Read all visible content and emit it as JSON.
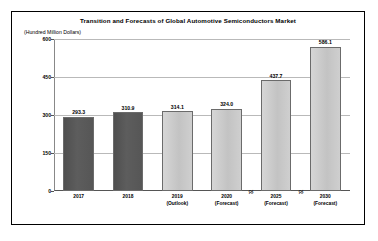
{
  "chart_data": {
    "type": "bar",
    "title": "Transition and Forecasts of Global Automotive Semiconductors Market",
    "unit_label": "(Hundred Million Dollars)",
    "xlabel": "",
    "ylabel": "",
    "ylim": [
      0,
      600
    ],
    "yticks": [
      "0",
      "150",
      "300",
      "450",
      "600"
    ],
    "ytick_values": [
      0,
      150,
      300,
      450,
      600
    ],
    "grid": true,
    "legend": "none",
    "axis_breaks": [
      {
        "after_category": "2020",
        "symbol": "≈"
      },
      {
        "after_category": "2025",
        "symbol": "≈"
      }
    ],
    "categories": [
      "2017",
      "2018",
      "2019",
      "2020",
      "2025",
      "2030"
    ],
    "category_notes": [
      "",
      "",
      "(Outlook)",
      "(Forecast)",
      "(Forecast)",
      "(Forecast)"
    ],
    "values": [
      293.3,
      310.9,
      314.1,
      324.0,
      437.7,
      586.1
    ],
    "value_labels": [
      "293.3",
      "310.9",
      "314.1",
      "324.0",
      "437.7",
      "586.1"
    ],
    "bar_styles": [
      "dark",
      "dark",
      "light",
      "light",
      "light",
      "light"
    ],
    "colors": {
      "bar_actual": "#555555",
      "bar_forecast": "#c9c9c9",
      "grid": "#b9b9b9",
      "axis": "#555555",
      "text": "#000000",
      "background": "#ffffff",
      "frame": "#000000"
    }
  }
}
